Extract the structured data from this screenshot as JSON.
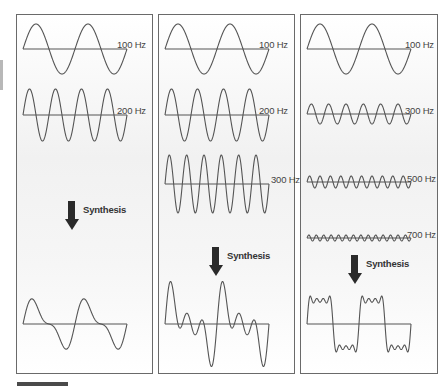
{
  "figure": {
    "colors": {
      "line": "#555555",
      "arrow": "#2a2a2a",
      "border": "#6a6a6a"
    },
    "panels": [
      {
        "id": "left",
        "components": [
          {
            "label": "100 Hz",
            "cycles": 2,
            "amplitude": 25,
            "baseline": 34
          },
          {
            "label": "200 Hz",
            "cycles": 4,
            "amplitude": 26,
            "baseline": 100
          }
        ],
        "arrow": {
          "label": "Synthesis",
          "top": 185
        },
        "result": {
          "type": "sum",
          "baseline": 309,
          "harmonics": [
            [
              1,
              1
            ],
            [
              2,
              0.45
            ]
          ],
          "scale": 20
        }
      },
      {
        "id": "middle",
        "components": [
          {
            "label": "100 Hz",
            "cycles": 2,
            "amplitude": 25,
            "baseline": 34
          },
          {
            "label": "200 Hz",
            "cycles": 4,
            "amplitude": 26,
            "baseline": 100
          },
          {
            "label": "300 Hz",
            "cycles": 6,
            "amplitude": 29,
            "baseline": 169
          }
        ],
        "arrow": {
          "label": "Synthesis",
          "top": 231
        },
        "result": {
          "type": "sum",
          "baseline": 309,
          "harmonics": [
            [
              1,
              1
            ],
            [
              2,
              1
            ],
            [
              3,
              1
            ]
          ],
          "scale": 17
        }
      },
      {
        "id": "right",
        "components": [
          {
            "label": "100 Hz",
            "cycles": 2,
            "amplitude": 25,
            "baseline": 34
          },
          {
            "label": "300 Hz",
            "cycles": 6,
            "amplitude": 10,
            "baseline": 99
          },
          {
            "label": "500 Hz",
            "cycles": 10,
            "amplitude": 6,
            "baseline": 167
          },
          {
            "label": "700 Hz",
            "cycles": 14,
            "amplitude": 3,
            "baseline": 223
          }
        ],
        "arrow": {
          "label": "Synthesis",
          "top": 239
        },
        "result": {
          "type": "sum",
          "baseline": 309,
          "harmonics": [
            [
              1,
              1
            ],
            [
              3,
              0.333
            ],
            [
              5,
              0.2
            ],
            [
              7,
              0.143
            ]
          ],
          "scale": 30
        }
      }
    ]
  }
}
